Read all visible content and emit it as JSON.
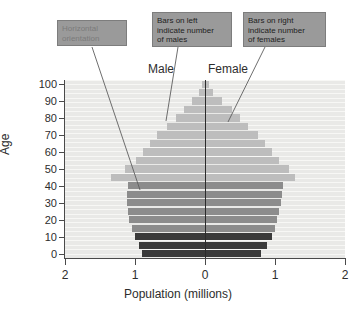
{
  "chart_data": {
    "type": "bar",
    "subtype": "population-pyramid",
    "title": "",
    "xlabel": "Population (millions)",
    "ylabel": "Age",
    "xlim": [
      -2,
      2
    ],
    "ylim": [
      0,
      100
    ],
    "x_tick_labels": [
      "2",
      "1",
      "0",
      "1",
      "2"
    ],
    "x_tick_values": [
      -2,
      -1,
      0,
      1,
      2
    ],
    "y_tick_labels": [
      "100",
      "90",
      "80",
      "70",
      "60",
      "50",
      "40",
      "30",
      "20",
      "10",
      "0"
    ],
    "y_tick_values": [
      100,
      90,
      80,
      70,
      60,
      50,
      40,
      30,
      20,
      10,
      0
    ],
    "grid": true,
    "legend": "none",
    "side_labels": {
      "left": "Male",
      "right": "Female"
    },
    "categories": [
      "0-4",
      "5-9",
      "10-14",
      "15-19",
      "20-24",
      "25-29",
      "30-34",
      "35-39",
      "40-44",
      "45-49",
      "50-54",
      "55-59",
      "60-64",
      "65-69",
      "70-74",
      "75-79",
      "80-84",
      "85-89",
      "90-94",
      "95-99",
      "100+"
    ],
    "series": [
      {
        "name": "Male",
        "side": "left",
        "values": [
          0.9,
          0.95,
          1.0,
          1.05,
          1.08,
          1.1,
          1.12,
          1.12,
          1.1,
          1.35,
          1.15,
          0.98,
          0.88,
          0.78,
          0.68,
          0.55,
          0.42,
          0.3,
          0.18,
          0.09,
          0.04
        ]
      },
      {
        "name": "Female",
        "side": "right",
        "values": [
          0.8,
          0.88,
          0.95,
          1.0,
          1.03,
          1.05,
          1.08,
          1.1,
          1.12,
          1.28,
          1.2,
          1.05,
          0.95,
          0.85,
          0.75,
          0.62,
          0.5,
          0.38,
          0.24,
          0.12,
          0.05
        ]
      }
    ],
    "band_colors": {
      "youth": "#3a3a3a",
      "working": "#8c8c8c",
      "older": "#bdbdbd"
    },
    "band_ranges": {
      "youth": "0-14",
      "working": "15-44",
      "older": "45-100+"
    },
    "zero_line_color": "#2b2b2b",
    "plot_background": "#e9e9e7"
  },
  "axes": {
    "x_title": "Population (millions)",
    "y_title": "Age"
  },
  "annotations": {
    "orientation": {
      "line1": "Horizontal",
      "line2": "orientation",
      "full": "Horizontal orientation"
    },
    "males": {
      "line1": "Bars on left",
      "line2": "indicate number",
      "line3": "of males",
      "full": "Bars on left indicate number of males"
    },
    "females": {
      "line1": "Bars on right",
      "line2": "indicate number",
      "line3": "of females",
      "full": "Bars on right indicate number of females"
    }
  }
}
